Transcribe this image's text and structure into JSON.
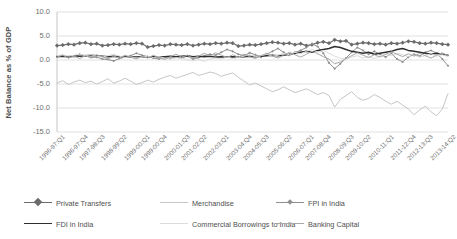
{
  "chart_data": {
    "type": "line",
    "title": "",
    "xlabel": "",
    "ylabel": "Net Balance as % of GDP",
    "ylim": [
      -15.0,
      10.0
    ],
    "yticks": [
      "10.0",
      "5.0",
      "0.0",
      "-5.0",
      "-10.0",
      "-15.0"
    ],
    "ytick_values": [
      10.0,
      5.0,
      0.0,
      -5.0,
      -10.0,
      -15.0
    ],
    "grid": true,
    "legend_position": "bottom",
    "x_tick_labels": [
      "1996-97:Q1",
      "1996-97:Q4",
      "1997-98:Q3",
      "1998-99:Q2",
      "1999-00:Q1",
      "1999-00:Q4",
      "2000-01:Q3",
      "2001-02:Q2",
      "2002-03:Q1",
      "2003-04:Q4",
      "2004-05:Q3",
      "2005-06:Q2",
      "2006-07:Q1",
      "2007-08:Q4",
      "2008-09:Q3",
      "2009-10:Q2",
      "2010-11:Q1",
      "2011-12:Q4",
      "2012-13:Q3",
      "2013-14:Q2"
    ],
    "x": [
      "1996-97:Q1",
      "1996-97:Q2",
      "1996-97:Q3",
      "1996-97:Q4",
      "1997-98:Q1",
      "1997-98:Q2",
      "1997-98:Q3",
      "1997-98:Q4",
      "1998-99:Q1",
      "1998-99:Q2",
      "1998-99:Q3",
      "1998-99:Q4",
      "1999-00:Q1",
      "1999-00:Q2",
      "1999-00:Q3",
      "1999-00:Q4",
      "2000-01:Q1",
      "2000-01:Q2",
      "2000-01:Q3",
      "2000-01:Q4",
      "2001-02:Q1",
      "2001-02:Q2",
      "2001-02:Q3",
      "2001-02:Q4",
      "2002-03:Q1",
      "2002-03:Q2",
      "2002-03:Q3",
      "2002-03:Q4",
      "2003-04:Q1",
      "2003-04:Q2",
      "2003-04:Q3",
      "2003-04:Q4",
      "2004-05:Q1",
      "2004-05:Q2",
      "2004-05:Q3",
      "2004-05:Q4",
      "2005-06:Q1",
      "2005-06:Q2",
      "2005-06:Q3",
      "2005-06:Q4",
      "2006-07:Q1",
      "2006-07:Q2",
      "2006-07:Q3",
      "2006-07:Q4",
      "2007-08:Q1",
      "2007-08:Q2",
      "2007-08:Q3",
      "2007-08:Q4",
      "2008-09:Q1",
      "2008-09:Q2",
      "2008-09:Q3",
      "2008-09:Q4",
      "2009-10:Q1",
      "2009-10:Q2",
      "2009-10:Q3",
      "2009-10:Q4",
      "2010-11:Q1",
      "2010-11:Q2",
      "2010-11:Q3",
      "2010-11:Q4",
      "2011-12:Q1",
      "2011-12:Q2",
      "2011-12:Q3",
      "2011-12:Q4",
      "2012-13:Q1",
      "2012-13:Q2",
      "2012-13:Q3",
      "2012-13:Q4",
      "2013-14:Q1",
      "2013-14:Q2"
    ],
    "series": [
      {
        "name": "Private Transfers",
        "color": "#6b6b6b",
        "width": 1.2,
        "marker": "diamond",
        "dash": "none",
        "values": [
          3.0,
          3.1,
          3.3,
          3.2,
          3.5,
          3.6,
          3.3,
          3.4,
          3.0,
          3.1,
          3.3,
          3.2,
          3.4,
          3.3,
          3.5,
          3.4,
          2.7,
          2.9,
          3.1,
          3.0,
          3.3,
          3.2,
          3.1,
          3.3,
          3.0,
          3.2,
          3.4,
          3.3,
          3.5,
          3.4,
          3.6,
          3.5,
          2.9,
          3.0,
          3.2,
          3.1,
          3.3,
          3.5,
          3.7,
          3.6,
          3.4,
          3.5,
          3.2,
          3.4,
          3.0,
          3.2,
          3.6,
          3.8,
          3.5,
          4.2,
          3.9,
          4.0,
          3.2,
          3.4,
          3.6,
          3.5,
          3.3,
          3.4,
          3.2,
          3.5,
          3.4,
          3.6,
          3.9,
          3.8,
          3.5,
          3.4,
          3.6,
          3.5,
          3.3,
          3.2
        ]
      },
      {
        "name": "Merchandise",
        "color": "#c6c6c6",
        "width": 1.0,
        "marker": "none",
        "dash": "none",
        "values": [
          -4.8,
          -4.3,
          -5.1,
          -4.6,
          -4.2,
          -4.7,
          -4.4,
          -5.0,
          -4.5,
          -3.9,
          -4.8,
          -4.4,
          -3.8,
          -4.4,
          -5.1,
          -4.7,
          -4.2,
          -4.6,
          -4.0,
          -3.6,
          -3.2,
          -3.8,
          -3.4,
          -3.0,
          -2.6,
          -3.2,
          -2.9,
          -2.5,
          -2.8,
          -3.4,
          -3.0,
          -2.7,
          -3.6,
          -4.4,
          -5.2,
          -4.8,
          -5.4,
          -6.0,
          -6.6,
          -6.2,
          -5.6,
          -6.2,
          -6.8,
          -6.4,
          -6.0,
          -6.6,
          -7.2,
          -6.8,
          -7.4,
          -9.8,
          -8.2,
          -7.4,
          -6.6,
          -7.8,
          -8.4,
          -8.0,
          -7.2,
          -7.8,
          -8.6,
          -9.2,
          -8.6,
          -9.4,
          -10.2,
          -11.4,
          -10.4,
          -9.6,
          -10.8,
          -11.6,
          -10.2,
          -7.0
        ]
      },
      {
        "name": "FPI in India",
        "color": "#8f8f8f",
        "width": 1.0,
        "marker": "smalldot",
        "dash": "none",
        "values": [
          0.8,
          0.9,
          0.6,
          0.7,
          1.2,
          0.9,
          0.5,
          0.6,
          0.2,
          0.1,
          -0.2,
          0.3,
          0.6,
          0.9,
          1.4,
          1.0,
          0.7,
          0.4,
          0.2,
          0.5,
          0.3,
          0.6,
          0.4,
          0.8,
          0.2,
          0.5,
          0.9,
          1.2,
          1.0,
          1.6,
          2.2,
          1.8,
          1.2,
          0.9,
          1.5,
          1.1,
          0.6,
          1.2,
          1.8,
          2.4,
          1.6,
          1.0,
          1.6,
          2.0,
          2.6,
          3.4,
          2.8,
          1.4,
          -0.6,
          -1.8,
          -0.8,
          0.4,
          1.6,
          2.6,
          2.0,
          1.2,
          1.8,
          1.2,
          0.6,
          1.4,
          0.2,
          -0.4,
          0.6,
          1.2,
          0.8,
          1.6,
          2.0,
          1.4,
          0.2,
          -1.2
        ]
      },
      {
        "name": "FDI in India",
        "color": "#2f2f2f",
        "width": 1.5,
        "marker": "none",
        "dash": "none",
        "values": [
          0.7,
          0.8,
          0.7,
          0.9,
          0.8,
          0.9,
          1.0,
          0.9,
          0.8,
          0.7,
          0.8,
          0.7,
          0.6,
          0.7,
          0.6,
          0.7,
          0.6,
          0.7,
          0.6,
          0.7,
          0.8,
          0.7,
          0.8,
          0.9,
          0.7,
          0.8,
          0.7,
          0.8,
          0.6,
          0.7,
          0.6,
          0.7,
          0.6,
          0.7,
          0.8,
          0.7,
          0.8,
          0.9,
          1.0,
          0.9,
          1.0,
          1.2,
          1.4,
          1.6,
          1.8,
          1.6,
          2.0,
          2.2,
          2.4,
          2.8,
          2.6,
          2.2,
          1.8,
          1.6,
          1.4,
          1.6,
          1.2,
          1.4,
          1.6,
          1.8,
          2.2,
          2.4,
          2.0,
          1.8,
          1.6,
          1.4,
          1.2,
          1.4,
          1.2,
          1.0
        ]
      },
      {
        "name": "Commercial Borrowings to India",
        "color": "#dcdcdc",
        "width": 1.0,
        "marker": "none",
        "dash": "none",
        "values": [
          0.9,
          1.1,
          0.8,
          1.0,
          1.2,
          0.9,
          1.1,
          0.8,
          0.6,
          0.9,
          1.2,
          0.8,
          0.5,
          0.7,
          0.4,
          0.6,
          0.8,
          0.5,
          0.7,
          0.4,
          0.2,
          0.5,
          0.3,
          0.1,
          -0.2,
          0.1,
          -0.3,
          0.2,
          0.4,
          0.2,
          0.6,
          0.3,
          0.5,
          0.8,
          1.1,
          0.7,
          0.9,
          1.2,
          0.8,
          1.0,
          1.4,
          1.1,
          1.6,
          1.3,
          1.8,
          2.2,
          1.6,
          2.0,
          1.4,
          0.8,
          0.4,
          0.2,
          0.6,
          0.9,
          0.4,
          0.7,
          0.3,
          0.8,
          1.2,
          0.9,
          1.4,
          1.1,
          0.7,
          1.0,
          0.6,
          0.9,
          1.3,
          0.8,
          1.1,
          0.7
        ]
      },
      {
        "name": "Banking Capital",
        "color": "#a8a8a8",
        "width": 1.0,
        "marker": "none",
        "dash": "none",
        "values": [
          0.6,
          1.0,
          0.4,
          0.8,
          0.3,
          0.9,
          0.5,
          1.1,
          0.7,
          0.2,
          0.8,
          0.4,
          1.0,
          0.6,
          0.2,
          0.8,
          0.4,
          1.0,
          0.5,
          0.1,
          0.7,
          1.2,
          0.6,
          1.0,
          0.4,
          0.8,
          1.4,
          0.9,
          1.5,
          1.0,
          0.5,
          1.1,
          0.6,
          1.2,
          0.7,
          0.3,
          0.9,
          1.4,
          0.8,
          0.4,
          1.0,
          1.6,
          1.1,
          0.6,
          1.2,
          1.8,
          1.3,
          0.7,
          0.2,
          -0.8,
          -0.4,
          0.3,
          0.9,
          1.5,
          1.0,
          0.5,
          1.1,
          0.6,
          1.2,
          1.7,
          1.2,
          0.7,
          1.3,
          0.8,
          1.4,
          0.9,
          0.4,
          1.0,
          1.5,
          0.9
        ]
      }
    ]
  },
  "legend": {
    "rows": [
      [
        {
          "name": "Private Transfers",
          "color": "#6b6b6b",
          "marker": "diamond",
          "width": 1.2
        },
        {
          "name": "Merchandise",
          "color": "#c6c6c6",
          "marker": "none",
          "width": 1.0
        },
        {
          "name": "FPI in India",
          "color": "#8f8f8f",
          "marker": "smalldot",
          "width": 1.0
        }
      ],
      [
        {
          "name": "FDI in India",
          "color": "#2f2f2f",
          "marker": "none",
          "width": 1.6
        },
        {
          "name": "Commercial Borrowings to India",
          "color": "#dcdcdc",
          "marker": "none",
          "width": 1.0
        },
        {
          "name": "Banking Capital",
          "color": "#a8a8a8",
          "marker": "none",
          "width": 1.0
        }
      ]
    ]
  },
  "colors": {
    "grid": "#d9d9d9",
    "axis": "#bfbfbf",
    "text": "#6e6e6e",
    "background": "#ffffff"
  }
}
